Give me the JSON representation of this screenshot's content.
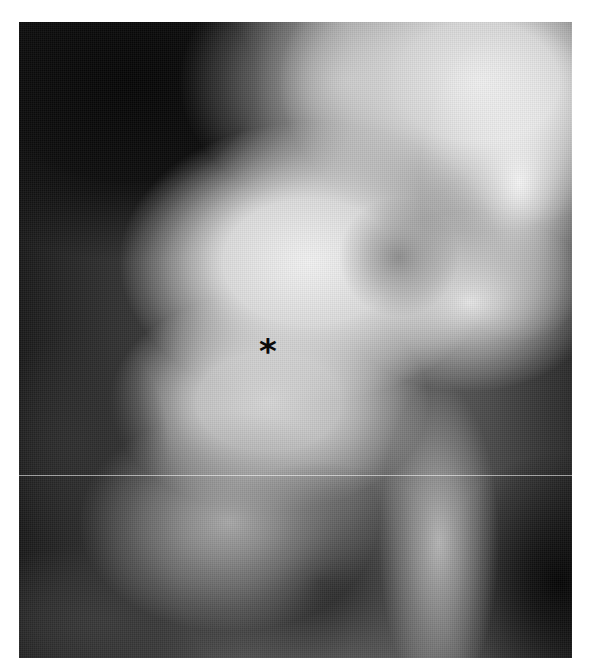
{
  "image": {
    "type": "radiograph",
    "description": "Grayscale X-ray showing bony spinal/vertebral structures",
    "annotation_marker": "*"
  },
  "colors": {
    "background": "#ffffff",
    "darkest": "#050505",
    "brightest": "#f2f2f2",
    "marker": "#0a0a0a"
  }
}
